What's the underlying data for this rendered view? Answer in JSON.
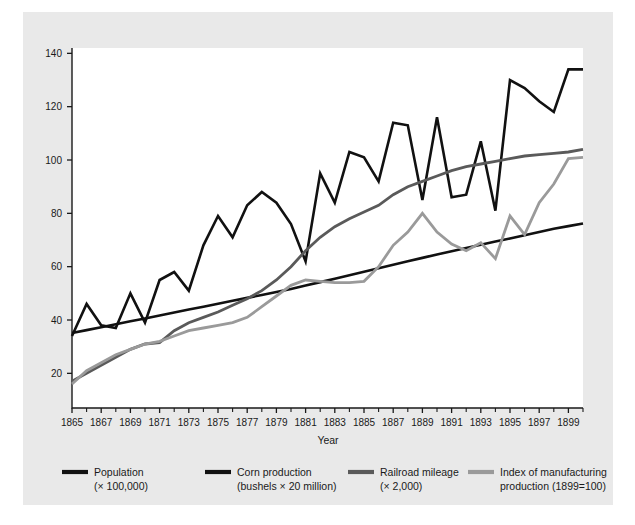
{
  "figure": {
    "background_color": "#ffffff",
    "panel_color": "#e9e9e9",
    "plot_background": "#ffffff"
  },
  "chart_data": {
    "type": "line",
    "title": "",
    "subtitle": "",
    "xlabel": "Year",
    "ylabel": "",
    "xlim": [
      1865,
      1900
    ],
    "ylim": [
      7,
      142
    ],
    "grid": false,
    "legend_position": "bottom",
    "x_tick_labels": [
      "1865",
      "1867",
      "1869",
      "1871",
      "1873",
      "1875",
      "1877",
      "1879",
      "1881",
      "1883",
      "1885",
      "1887",
      "1889",
      "1891",
      "1893",
      "1895",
      "1897",
      "1899"
    ],
    "x_tick_values": [
      1865,
      1867,
      1869,
      1871,
      1873,
      1875,
      1877,
      1879,
      1881,
      1883,
      1885,
      1887,
      1889,
      1891,
      1893,
      1895,
      1897,
      1899
    ],
    "x_minor_ticks": [
      1866,
      1868,
      1870,
      1872,
      1874,
      1876,
      1878,
      1880,
      1882,
      1884,
      1886,
      1888,
      1890,
      1892,
      1894,
      1896,
      1898,
      1900
    ],
    "y_tick_labels": [
      "20",
      "40",
      "60",
      "80",
      "100",
      "120",
      "140"
    ],
    "y_tick_values": [
      20,
      40,
      60,
      80,
      100,
      120,
      140
    ],
    "x": [
      1865,
      1866,
      1867,
      1868,
      1869,
      1870,
      1871,
      1872,
      1873,
      1874,
      1875,
      1876,
      1877,
      1878,
      1879,
      1880,
      1881,
      1882,
      1883,
      1884,
      1885,
      1886,
      1887,
      1888,
      1889,
      1890,
      1891,
      1892,
      1893,
      1894,
      1895,
      1896,
      1897,
      1898,
      1899,
      1900
    ],
    "series": [
      {
        "name": "Population",
        "units": "(× 100,000)",
        "color": "#111111",
        "line_width": 2.6,
        "values": [
          35.1,
          36.2,
          37.3,
          38.4,
          39.5,
          40.6,
          41.7,
          42.8,
          43.9,
          45.0,
          46.1,
          47.2,
          48.3,
          49.4,
          50.5,
          51.6,
          52.9,
          54.2,
          55.5,
          56.8,
          58.1,
          59.4,
          60.7,
          62.0,
          63.3,
          64.6,
          65.8,
          67.0,
          68.2,
          69.4,
          70.6,
          71.8,
          73.0,
          74.2,
          75.2,
          76.2
        ]
      },
      {
        "name": "Corn production",
        "units": "(bushels × 20 million)",
        "color": "#111111",
        "line_width": 2.6,
        "values": [
          34.0,
          46.0,
          38.0,
          37.0,
          50.0,
          39.0,
          55.0,
          58.0,
          51.0,
          68.0,
          79.0,
          71.0,
          83.0,
          88.0,
          84.0,
          76.0,
          62.0,
          95.0,
          84.0,
          103.0,
          101.0,
          92.0,
          114.0,
          113.0,
          85.0,
          116.0,
          86.0,
          87.0,
          107.0,
          81.0,
          130.0,
          127.0,
          122.0,
          118.0,
          134.0,
          134.0
        ]
      },
      {
        "name": "Railroad mileage",
        "units": "(× 2,000)",
        "color": "#5a5a5a",
        "line_width": 2.8,
        "values": [
          17.0,
          20.0,
          23.0,
          26.0,
          29.0,
          31.0,
          31.5,
          36.0,
          39.0,
          41.0,
          43.0,
          45.5,
          48.0,
          51.0,
          55.0,
          60.0,
          66.0,
          71.0,
          75.0,
          78.0,
          80.5,
          83.0,
          87.0,
          90.0,
          92.0,
          94.0,
          96.0,
          97.5,
          98.5,
          99.5,
          100.5,
          101.5,
          102.0,
          102.5,
          103.0,
          104.0
        ]
      },
      {
        "name": "Index of manufacturing production",
        "units": "(1899=100)",
        "color": "#9a9a9a",
        "line_width": 2.8,
        "values": [
          16.0,
          21.0,
          24.0,
          27.0,
          29.0,
          31.0,
          32.0,
          34.0,
          36.0,
          37.0,
          38.0,
          39.0,
          41.0,
          45.0,
          49.0,
          53.0,
          55.0,
          54.5,
          54.0,
          54.0,
          54.5,
          60.0,
          68.0,
          73.0,
          80.0,
          73.0,
          68.5,
          66.0,
          69.0,
          63.0,
          79.0,
          72.0,
          84.0,
          91.0,
          100.5,
          101.0
        ]
      }
    ]
  },
  "legend": {
    "items": [
      {
        "label": "Population",
        "sublabel": "(× 100,000)",
        "color": "#111111"
      },
      {
        "label": "Corn production",
        "sublabel": "(bushels × 20 million)",
        "color": "#111111"
      },
      {
        "label": "Railroad mileage",
        "sublabel": "(× 2,000)",
        "color": "#5a5a5a"
      },
      {
        "label": "Index of manufacturing",
        "sublabel": "production (1899=100)",
        "color": "#9a9a9a"
      }
    ]
  }
}
